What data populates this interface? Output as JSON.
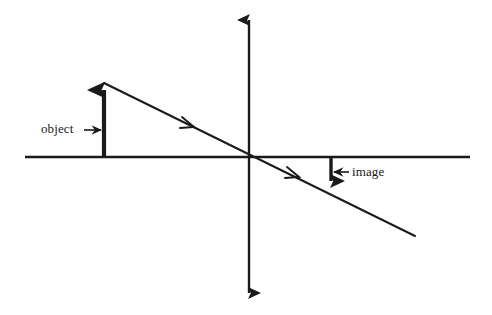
{
  "diagram": {
    "type": "optics-ray-diagram",
    "background_color": "#ffffff",
    "stroke_color": "#1a1a1a",
    "labels": {
      "object": "object",
      "image": "image"
    },
    "geometry": {
      "origin": {
        "x": 249,
        "y": 157
      },
      "optical_axis": {
        "name": "horizontal-optical-axis",
        "x1": 25,
        "y1": 157,
        "x2": 470,
        "y2": 157,
        "stroke_width": 2.6,
        "arrowheads": "none"
      },
      "lens_axis": {
        "name": "vertical-lens-axis",
        "x1": 249,
        "y1": 16,
        "x2": 249,
        "y2": 297,
        "stroke_width": 2.4,
        "arrowheads": "both"
      },
      "object_arrow": {
        "name": "object-arrow",
        "x": 104,
        "base_y": 157,
        "tip_y": 83,
        "direction": "up",
        "height": 74,
        "stroke_width": 4.2
      },
      "image_arrow": {
        "name": "image-arrow",
        "x": 331,
        "base_y": 157,
        "tip_y": 190,
        "direction": "down",
        "height": 33,
        "stroke_width": 3.4
      },
      "principal_ray": {
        "name": "principal-ray",
        "x1": 104,
        "y1": 83,
        "x2": 415,
        "y2": 236,
        "stroke_width": 2.0,
        "passes_through_origin": true,
        "direction_markers": [
          {
            "x": 190,
            "y": 125
          },
          {
            "x": 295,
            "y": 175
          }
        ]
      },
      "object_label_pointer": {
        "name": "object-label-pointer",
        "x1": 84,
        "y1": 130,
        "x2": 101,
        "y2": 130,
        "direction": "right"
      },
      "image_label_pointer": {
        "name": "image-label-pointer",
        "x1": 349,
        "y1": 172,
        "x2": 334,
        "y2": 172,
        "direction": "left"
      }
    }
  }
}
